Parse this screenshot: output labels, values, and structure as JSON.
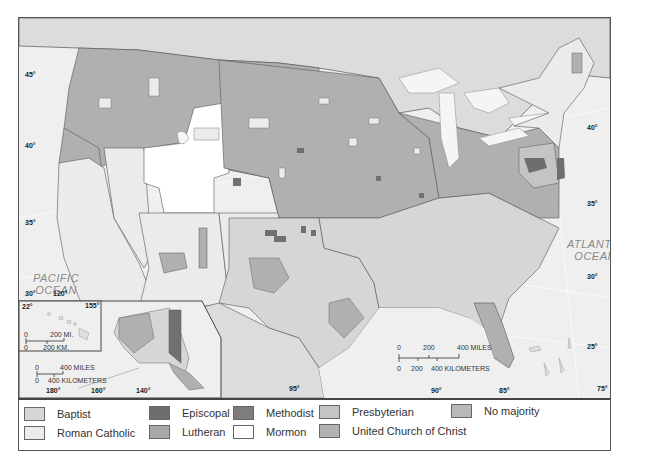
{
  "map": {
    "title": "Religious majority by county, United States",
    "oceans": {
      "pacific": [
        "PACIFIC",
        "OCEAN"
      ],
      "atlantic": [
        "ATLANTIC",
        "OCEAN"
      ]
    },
    "latitude_labels_left": [
      "45°",
      "40°",
      "35°",
      "30°"
    ],
    "latitude_labels_right": [
      "40°",
      "35°",
      "30°",
      "25°"
    ],
    "longitude_labels_bottom": [
      "95°",
      "90°",
      "85°",
      "75°"
    ],
    "corner_label": "120°",
    "main_scale": {
      "miles_ticks": [
        "0",
        "200",
        "400 MILES"
      ],
      "km_ticks": [
        "0",
        "200",
        "400 KILOMETERS"
      ]
    },
    "hawaii_inset": {
      "lat_label": "22°",
      "lon_label": "155°",
      "scale_miles": [
        "0",
        "200 MI."
      ],
      "scale_km": [
        "0",
        "200 KM."
      ]
    },
    "alaska_inset": {
      "scale_miles": [
        "0",
        "400 MILES"
      ],
      "scale_km": [
        "0",
        "400 KILOMETERS"
      ],
      "lon_labels": [
        "180°",
        "160°",
        "140°"
      ]
    }
  },
  "legend": {
    "items": [
      {
        "label": "Baptist",
        "color": "#d6d6d6"
      },
      {
        "label": "Roman Catholic",
        "color": "#ebebeb"
      },
      {
        "label": "Episcopal",
        "color": "#6e6e6e"
      },
      {
        "label": "Lutheran",
        "color": "#a9a9a9"
      },
      {
        "label": "Methodist",
        "color": "#7d7d7d"
      },
      {
        "label": "Mormon",
        "color": "#ffffff"
      },
      {
        "label": "Presbyterian",
        "color": "#c4c4c4"
      },
      {
        "label": "United Church of Christ",
        "color": "#b3b3b3"
      },
      {
        "label": "No majority",
        "color": "#b8b8b8"
      }
    ]
  }
}
